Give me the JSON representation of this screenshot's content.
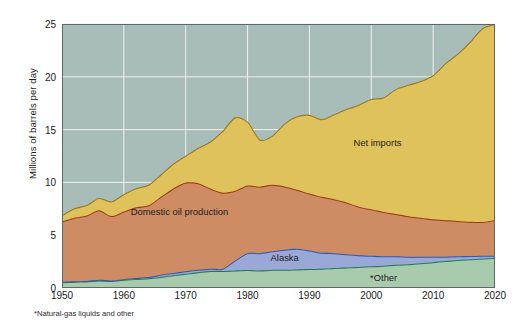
{
  "chart_data": {
    "type": "area",
    "stacked": true,
    "title": "",
    "xlabel": "",
    "ylabel": "Millions of barrels per day",
    "xlim": [
      1950,
      2020
    ],
    "ylim": [
      0,
      25
    ],
    "xticks": [
      1950,
      1960,
      1970,
      1980,
      1990,
      2000,
      2010,
      2020
    ],
    "yticks": [
      0,
      5,
      10,
      15,
      20,
      25
    ],
    "grid": true,
    "footnote": "*Natural-gas liquids and other",
    "plot_background": "#a9bdb8",
    "x": [
      1950,
      1952,
      1954,
      1956,
      1958,
      1960,
      1962,
      1964,
      1966,
      1968,
      1970,
      1972,
      1974,
      1976,
      1978,
      1980,
      1982,
      1984,
      1986,
      1988,
      1990,
      1992,
      1994,
      1996,
      1998,
      2000,
      2002,
      2004,
      2006,
      2008,
      2010,
      2012,
      2014,
      2016,
      2018,
      2020
    ],
    "series": [
      {
        "name": "*Other",
        "key": "other",
        "color": "#a8cbad",
        "line_color": "#1f7a4d",
        "label_x": 2002,
        "label_y": 1.0,
        "values": [
          0.55,
          0.6,
          0.62,
          0.72,
          0.66,
          0.78,
          0.86,
          0.93,
          1.05,
          1.2,
          1.35,
          1.5,
          1.6,
          1.6,
          1.66,
          1.7,
          1.65,
          1.72,
          1.72,
          1.76,
          1.8,
          1.83,
          1.9,
          1.95,
          2.0,
          2.05,
          2.1,
          2.2,
          2.25,
          2.35,
          2.45,
          2.55,
          2.65,
          2.72,
          2.8,
          2.85
        ]
      },
      {
        "name": "Alaska",
        "key": "alaska",
        "color": "#9aa8d8",
        "line_color": "#2a5bb5",
        "label_x": 1986,
        "label_y": 2.9,
        "values": [
          0.05,
          0.05,
          0.05,
          0.05,
          0.05,
          0.06,
          0.08,
          0.1,
          0.2,
          0.22,
          0.23,
          0.22,
          0.22,
          0.23,
          0.95,
          1.6,
          1.65,
          1.75,
          1.9,
          1.95,
          1.75,
          1.5,
          1.4,
          1.25,
          1.1,
          1.0,
          0.9,
          0.8,
          0.7,
          0.6,
          0.5,
          0.42,
          0.35,
          0.3,
          0.25,
          0.2
        ]
      },
      {
        "name": "Domestic oil production",
        "key": "domestic",
        "color": "#cd8c63",
        "line_color": "#9c3a11",
        "label_x": 1969,
        "label_y": 7.3,
        "values": [
          5.7,
          6.0,
          6.2,
          6.6,
          6.1,
          6.4,
          6.7,
          6.8,
          7.4,
          8.0,
          8.4,
          8.2,
          7.6,
          7.2,
          6.6,
          6.4,
          6.3,
          6.3,
          6.0,
          5.6,
          5.4,
          5.3,
          5.1,
          4.9,
          4.6,
          4.4,
          4.2,
          4.0,
          3.85,
          3.7,
          3.55,
          3.45,
          3.35,
          3.25,
          3.2,
          3.4
        ]
      },
      {
        "name": "Net imports",
        "key": "imports",
        "color": "#e0c25c",
        "line_color": "#9a7a1d",
        "label_x": 2001,
        "label_y": 13.8,
        "values": [
          0.55,
          0.85,
          0.95,
          1.1,
          1.35,
          1.6,
          1.75,
          1.9,
          2.05,
          2.3,
          2.5,
          3.3,
          4.4,
          5.8,
          6.9,
          6.0,
          4.4,
          4.6,
          5.9,
          6.9,
          7.4,
          7.3,
          8.0,
          8.8,
          9.6,
          10.4,
          10.8,
          11.8,
          12.4,
          12.9,
          13.6,
          14.8,
          15.8,
          17.0,
          18.3,
          18.5
        ]
      }
    ],
    "total_label": "Total consumption",
    "totals_note": "Top of stacked area = total U.S. oil consumption"
  },
  "axis": {
    "ylabel": "Millions of barrels per day",
    "ytick_labels": [
      "0",
      "5",
      "10",
      "15",
      "20",
      "25"
    ],
    "xtick_labels": [
      "1950",
      "1960",
      "1970",
      "1980",
      "1990",
      "2000",
      "2010",
      "2020"
    ]
  },
  "labels": {
    "net_imports": "Net imports",
    "domestic": "Domestic oil production",
    "alaska": "Alaska",
    "other": "*Other"
  },
  "footnote": "*Natural-gas liquids and other"
}
